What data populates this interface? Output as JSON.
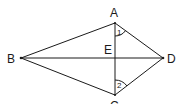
{
  "diagram": {
    "type": "geometry-kite",
    "points": {
      "A": {
        "label": "A",
        "x": 115,
        "y": 23
      },
      "B": {
        "label": "B",
        "x": 21,
        "y": 58
      },
      "C": {
        "label": "C",
        "x": 115,
        "y": 95
      },
      "D": {
        "label": "D",
        "x": 163,
        "y": 58
      },
      "E": {
        "label": "E",
        "x": 115,
        "y": 58
      }
    },
    "segments": [
      "AB",
      "BC",
      "CD",
      "DA",
      "AC",
      "BD"
    ],
    "angles": [
      {
        "label": "1",
        "vertex": "A",
        "between": [
          "AE",
          "AD"
        ]
      },
      {
        "label": "2",
        "vertex": "C",
        "between": [
          "CE",
          "CD"
        ]
      }
    ],
    "colors": {
      "stroke": "#1a1a1a",
      "background": "#ffffff"
    }
  }
}
